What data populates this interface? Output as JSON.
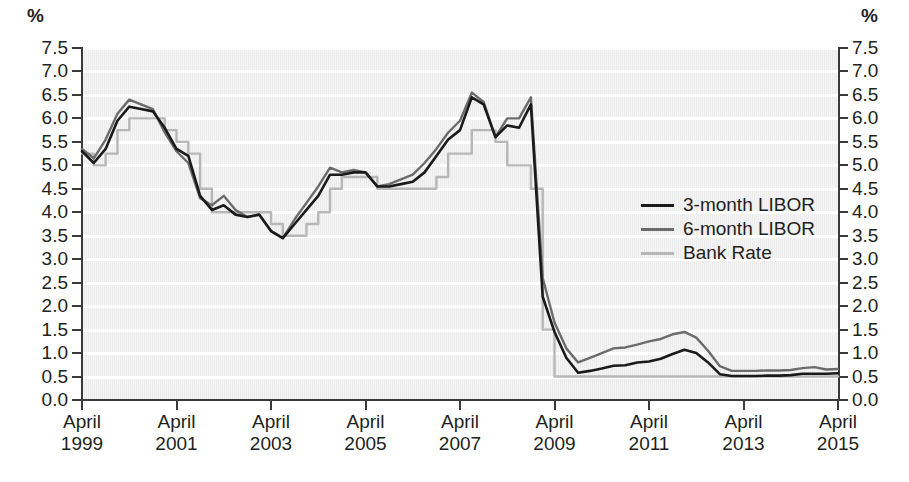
{
  "axis": {
    "unit_label_left": "%",
    "unit_label_right": "%",
    "y_ticks": [
      "7.5",
      "7.0",
      "6.5",
      "6.0",
      "5.5",
      "5.0",
      "4.5",
      "4.0",
      "3.5",
      "3.0",
      "2.5",
      "2.0",
      "1.5",
      "1.0",
      "0.5",
      "0.0"
    ],
    "x_ticks": [
      {
        "month": "April",
        "year": "1999"
      },
      {
        "month": "April",
        "year": "2001"
      },
      {
        "month": "April",
        "year": "2003"
      },
      {
        "month": "April",
        "year": "2005"
      },
      {
        "month": "April",
        "year": "2007"
      },
      {
        "month": "April",
        "year": "2009"
      },
      {
        "month": "April",
        "year": "2011"
      },
      {
        "month": "April",
        "year": "2013"
      },
      {
        "month": "April",
        "year": "2015"
      }
    ]
  },
  "legend": {
    "position": "inside-right",
    "entries": [
      {
        "label": "3-month LIBOR",
        "color": "#1a1a1a"
      },
      {
        "label": "6-month LIBOR",
        "color": "#6b6b6b"
      },
      {
        "label": "Bank Rate",
        "color": "#b7b7b7"
      }
    ]
  },
  "colors": {
    "plot_background": "#ececec",
    "gridline": "#ffffff",
    "axis": "#3a3a3a",
    "three_month_libor": "#1a1a1a",
    "six_month_libor": "#6b6b6b",
    "bank_rate": "#b7b7b7",
    "text": "#231f20"
  },
  "chart_data": {
    "type": "line",
    "title": "",
    "subtitle": "",
    "xlabel": "",
    "ylabel": "%",
    "ylim": [
      0.0,
      7.5
    ],
    "xlim": [
      "1999-04",
      "2015-04"
    ],
    "ytick_step": 0.5,
    "grid": true,
    "legend_position": "inside-right",
    "x_axis_type": "time-monthly",
    "x": [
      "1999-04",
      "1999-07",
      "1999-10",
      "2000-01",
      "2000-04",
      "2000-07",
      "2000-10",
      "2001-01",
      "2001-04",
      "2001-07",
      "2001-10",
      "2002-01",
      "2002-04",
      "2002-07",
      "2002-10",
      "2003-01",
      "2003-04",
      "2003-07",
      "2003-10",
      "2004-01",
      "2004-04",
      "2004-07",
      "2004-10",
      "2005-01",
      "2005-04",
      "2005-07",
      "2005-10",
      "2006-01",
      "2006-04",
      "2006-07",
      "2006-10",
      "2007-01",
      "2007-04",
      "2007-07",
      "2007-10",
      "2008-01",
      "2008-04",
      "2008-07",
      "2008-10",
      "2009-01",
      "2009-04",
      "2009-07",
      "2009-10",
      "2010-01",
      "2010-04",
      "2010-07",
      "2010-10",
      "2011-01",
      "2011-04",
      "2011-07",
      "2011-10",
      "2012-01",
      "2012-04",
      "2012-07",
      "2012-10",
      "2013-01",
      "2013-04",
      "2013-07",
      "2013-10",
      "2014-01",
      "2014-04",
      "2014-07",
      "2014-10",
      "2015-01",
      "2015-04"
    ],
    "series": [
      {
        "name": "3-month LIBOR",
        "color": "#1a1a1a",
        "values": [
          5.3,
          5.05,
          5.35,
          5.95,
          6.25,
          6.2,
          6.15,
          5.8,
          5.35,
          5.2,
          4.35,
          4.05,
          4.15,
          3.95,
          3.9,
          3.95,
          3.6,
          3.45,
          3.75,
          4.05,
          4.35,
          4.8,
          4.8,
          4.85,
          4.85,
          4.55,
          4.55,
          4.6,
          4.65,
          4.85,
          5.2,
          5.55,
          5.75,
          6.45,
          6.3,
          5.6,
          5.85,
          5.8,
          6.3,
          2.2,
          1.45,
          0.9,
          0.58,
          0.62,
          0.67,
          0.73,
          0.74,
          0.8,
          0.82,
          0.88,
          0.98,
          1.07,
          1.0,
          0.8,
          0.55,
          0.51,
          0.51,
          0.51,
          0.52,
          0.52,
          0.53,
          0.56,
          0.56,
          0.56,
          0.57
        ]
      },
      {
        "name": "6-month LIBOR",
        "color": "#6b6b6b",
        "values": [
          5.35,
          5.15,
          5.55,
          6.1,
          6.4,
          6.3,
          6.2,
          5.7,
          5.3,
          5.05,
          4.3,
          4.15,
          4.35,
          4.05,
          3.9,
          3.95,
          3.6,
          3.45,
          3.85,
          4.2,
          4.55,
          4.95,
          4.85,
          4.9,
          4.85,
          4.55,
          4.6,
          4.7,
          4.8,
          5.05,
          5.35,
          5.7,
          5.95,
          6.55,
          6.35,
          5.6,
          6.0,
          6.0,
          6.45,
          2.6,
          1.65,
          1.1,
          0.8,
          0.9,
          1.0,
          1.1,
          1.12,
          1.18,
          1.25,
          1.3,
          1.4,
          1.45,
          1.33,
          1.05,
          0.72,
          0.62,
          0.62,
          0.62,
          0.63,
          0.63,
          0.64,
          0.68,
          0.7,
          0.65,
          0.66
        ]
      },
      {
        "name": "Bank Rate",
        "color": "#b7b7b7",
        "values": [
          5.25,
          5.0,
          5.25,
          5.75,
          6.0,
          6.0,
          6.0,
          5.75,
          5.5,
          5.25,
          4.5,
          4.0,
          4.0,
          4.0,
          4.0,
          4.0,
          3.75,
          3.5,
          3.5,
          3.75,
          4.0,
          4.5,
          4.75,
          4.75,
          4.75,
          4.5,
          4.5,
          4.5,
          4.5,
          4.5,
          4.75,
          5.25,
          5.25,
          5.75,
          5.75,
          5.5,
          5.0,
          5.0,
          4.5,
          1.5,
          0.5,
          0.5,
          0.5,
          0.5,
          0.5,
          0.5,
          0.5,
          0.5,
          0.5,
          0.5,
          0.5,
          0.5,
          0.5,
          0.5,
          0.5,
          0.5,
          0.5,
          0.5,
          0.5,
          0.5,
          0.5,
          0.5,
          0.5,
          0.5,
          0.5
        ]
      }
    ]
  }
}
